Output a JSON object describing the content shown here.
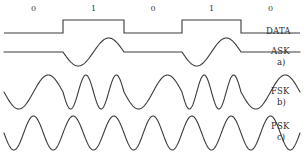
{
  "figure": {
    "background_color": "#ffffff",
    "line_color": "#3a3a3a",
    "text_color": "#2b2b2b",
    "line_width": 1.1
  },
  "bit_sequence": {
    "bits": [
      "0",
      "1",
      "0",
      "1",
      "0"
    ],
    "boundaries_px": [
      4,
      63,
      124,
      182,
      241,
      300
    ],
    "label_y_px": 4
  },
  "signals": [
    {
      "key": "data",
      "label": "DATA",
      "sublabel": "",
      "type": "square",
      "baseline_y_px": 33,
      "high_y_px": 20,
      "label_x_px": 266,
      "label_y_px": 26
    },
    {
      "key": "ask",
      "label": "ASK",
      "sublabel": "a)",
      "type": "amplitude-shift-keying",
      "baseline_y_px": 52,
      "amplitude_px": 14,
      "cycles_per_one_bit": 1,
      "cycles_per_zero_bit": 0,
      "label_x_px": 271,
      "label_y_px": 46,
      "sublabel_x_px": 277,
      "sublabel_y_px": 57
    },
    {
      "key": "fsk",
      "label": "FSK",
      "sublabel": "b)",
      "type": "frequency-shift-keying",
      "baseline_y_px": 92,
      "amplitude_px": 17,
      "cycles_per_one_bit": 2,
      "cycles_per_zero_bit": 1,
      "label_x_px": 271,
      "label_y_px": 86,
      "sublabel_x_px": 277,
      "sublabel_y_px": 97
    },
    {
      "key": "psk",
      "label": "PSK",
      "sublabel": "c)",
      "type": "phase-shift-keying",
      "baseline_y_px": 133,
      "amplitude_px": 17,
      "cycles_per_bit": 1.5,
      "phase_flip_at_bit_boundary": true,
      "label_x_px": 271,
      "label_y_px": 121,
      "sublabel_x_px": 277,
      "sublabel_y_px": 132
    }
  ]
}
